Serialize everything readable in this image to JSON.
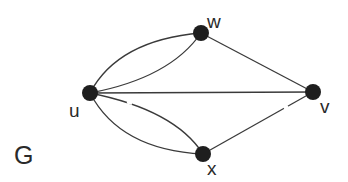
{
  "graph": {
    "name": "G",
    "vertices": [
      {
        "id": "u",
        "label": "u"
      },
      {
        "id": "w",
        "label": "w"
      },
      {
        "id": "v",
        "label": "v"
      },
      {
        "id": "x",
        "label": "x"
      }
    ],
    "edges": [
      {
        "from": "u",
        "to": "w",
        "multiplicity": 2
      },
      {
        "from": "u",
        "to": "x",
        "multiplicity": 2
      },
      {
        "from": "u",
        "to": "v",
        "multiplicity": 1
      },
      {
        "from": "w",
        "to": "v",
        "multiplicity": 1
      },
      {
        "from": "x",
        "to": "v",
        "multiplicity": 1
      }
    ]
  },
  "colors": {
    "node": "#1e1e1e",
    "edge": "#3a3a3a",
    "background": "#ffffff"
  }
}
